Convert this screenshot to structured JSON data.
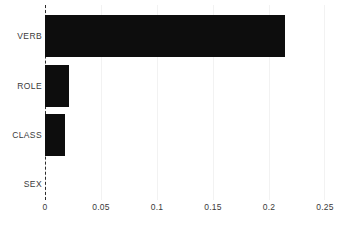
{
  "chart_data": {
    "type": "bar",
    "orientation": "horizontal",
    "title": "",
    "subtitle": "",
    "xlabel": "",
    "ylabel": "",
    "categories": [
      "VERB",
      "ROLE",
      "CLASS",
      "SEX"
    ],
    "values": [
      0.214,
      0.021,
      0.018,
      0.0
    ],
    "series": [
      {
        "name": "",
        "values": [
          0.214,
          0.021,
          0.018,
          0.0
        ]
      }
    ],
    "xlim": [
      0,
      0.25
    ],
    "xticks": [
      0,
      0.05,
      0.1,
      0.15,
      0.2,
      0.25
    ],
    "xtick_labels": [
      "0",
      "0.05",
      "0.1",
      "0.15",
      "0.2",
      "0.25"
    ],
    "grid": "vertical",
    "legend": "none",
    "annotations": []
  },
  "style": {
    "bar_color": "#0d0d0d",
    "grid_color": "#f2f2f2",
    "axis_color": "#2b2b2b",
    "text_color": "#3a3a3a",
    "background": "#ffffff"
  }
}
